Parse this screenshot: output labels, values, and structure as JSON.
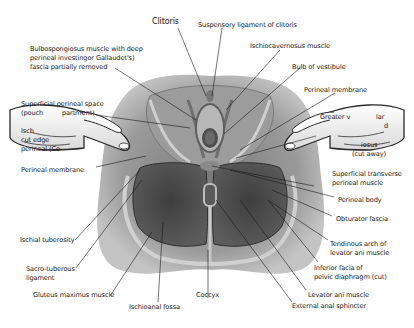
{
  "figure": {
    "colors": {
      "background": "#ffffff",
      "skin_outer": "#a9a9a9",
      "skin_mid": "#8e8e8e",
      "muscle_dark": "#4a4a4a",
      "muscle_mid": "#6b6b6b",
      "fascia_light": "#d4d4d4",
      "glove": "#f2f2f2",
      "leader_line": "#1a1a1a",
      "text": "#1a1a1a"
    }
  },
  "labels": {
    "top": {
      "clitoris": "Clitoris",
      "suspensory_ligament": "Suspensory ligament of clitoris"
    },
    "left": {
      "bulbospongiosus_line1": "Bulbospongiosus muscle with deep",
      "bulbospongiosus_line2": "perineal investingor Gallaudet's)",
      "bulbospongiosus_line3": "fascia partially removed",
      "superficial_space_line1": "Superficial perineal space",
      "superficial_space_line2a": "(pouch",
      "superficial_space_line2b": "partment)",
      "ischio_cut_line1": "Isch",
      "ischio_cut_line2": "cut edge",
      "ischio_cut_line3": "perineal (Co",
      "perineal_membrane": "Perineal membrane",
      "ischial_tuberosity": "Ischial tuberosity",
      "sacrotuberous_line1": "Sacro-tuberous",
      "sacrotuberous_line2": "ligament",
      "gluteus_maximus": "Gluteus maximus muscle"
    },
    "bottom": {
      "ischioanal_fossa": "Ischioanal fossa",
      "coccyx": "Coccyx"
    },
    "right": {
      "ischiocavernosus": "Ischiocavernosus muscle",
      "bulb_of_vestibule": "Bulb of vestibule",
      "perineal_membrane": "Perineal membrane",
      "greater_vestibular_line1a": "Greater v",
      "greater_vestibular_line1b": "lar",
      "greater_vestibular_line2": "d",
      "bulbospongiosus_cut_line1": "iosus",
      "bulbospongiosus_cut_line2": "(cut away)",
      "superficial_transverse_line1": "Superficial transverse",
      "superficial_transverse_line2": "perineal muscle",
      "perineal_body": "Perineal body",
      "obturator_fascia": "Obturator fascia",
      "tendinous_arch_line1": "Tendinous arch of",
      "tendinous_arch_line2": "levator ani muscle",
      "inferior_fascia_line1": "Inferior facia of",
      "inferior_fascia_line2": "pelvic diaphragm (cut)",
      "levator_ani": "Levator ani muscle",
      "external_anal_sphincter": "External anal sphincter"
    }
  }
}
